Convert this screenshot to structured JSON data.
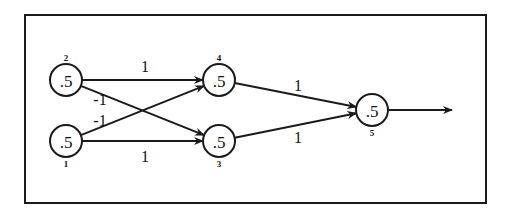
{
  "diagram": {
    "type": "neural-network",
    "frame": {
      "x": 25,
      "y": 15,
      "width": 461,
      "height": 188
    },
    "colors": {
      "stroke": "#1a1a1a",
      "background": "#ffffff",
      "text": "#111111"
    },
    "node_radius": 16,
    "nodes": [
      {
        "id": "1",
        "index_label": "1",
        "value": ".5",
        "cx": 66,
        "cy": 141,
        "index_pos": "below"
      },
      {
        "id": "2",
        "index_label": "2",
        "value": ".5",
        "cx": 66,
        "cy": 80,
        "index_pos": "above"
      },
      {
        "id": "3",
        "index_label": "3",
        "value": ".5",
        "cx": 219,
        "cy": 141,
        "index_pos": "below"
      },
      {
        "id": "4",
        "index_label": "4",
        "value": ".5",
        "cx": 219,
        "cy": 80,
        "index_pos": "above"
      },
      {
        "id": "5",
        "index_label": "5",
        "value": ".5",
        "cx": 372,
        "cy": 110,
        "index_pos": "below"
      }
    ],
    "edges": [
      {
        "from": "2",
        "to": "4",
        "weight": "1",
        "label_x": 145,
        "label_y": 66
      },
      {
        "from": "1",
        "to": "3",
        "weight": "1",
        "label_x": 145,
        "label_y": 156
      },
      {
        "from": "2",
        "to": "3",
        "weight": "-1",
        "label_x": 100,
        "label_y": 99
      },
      {
        "from": "1",
        "to": "4",
        "weight": "-1",
        "label_x": 100,
        "label_y": 120
      },
      {
        "from": "4",
        "to": "5",
        "weight": "1",
        "label_x": 298,
        "label_y": 85
      },
      {
        "from": "3",
        "to": "5",
        "weight": "1",
        "label_x": 298,
        "label_y": 137
      }
    ],
    "output": {
      "from": "5",
      "x1": 388,
      "y1": 110,
      "x2": 452,
      "y2": 110
    }
  }
}
